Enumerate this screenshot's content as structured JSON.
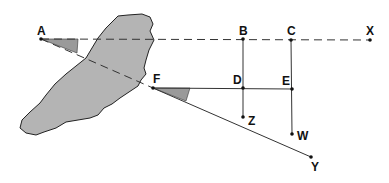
{
  "diagram": {
    "colors": {
      "island_fill": "#b4b4b4",
      "stroke": "#222222",
      "angle_fill": "#9a9a9a"
    },
    "points": [
      {
        "name": "A",
        "x": 41,
        "y": 39
      },
      {
        "name": "B",
        "x": 243,
        "y": 39
      },
      {
        "name": "C",
        "x": 291,
        "y": 40
      },
      {
        "name": "X",
        "x": 370,
        "y": 40
      },
      {
        "name": "F",
        "x": 153,
        "y": 88
      },
      {
        "name": "D",
        "x": 243,
        "y": 88
      },
      {
        "name": "E",
        "x": 292,
        "y": 89
      },
      {
        "name": "Z",
        "x": 243,
        "y": 117
      },
      {
        "name": "W",
        "x": 292,
        "y": 134
      },
      {
        "name": "Y",
        "x": 311,
        "y": 157
      }
    ],
    "labels": {
      "A": "A",
      "B": "B",
      "C": "C",
      "X": "X",
      "F": "F",
      "D": "D",
      "E": "E",
      "Z": "Z",
      "W": "W",
      "Y": "Y"
    }
  }
}
